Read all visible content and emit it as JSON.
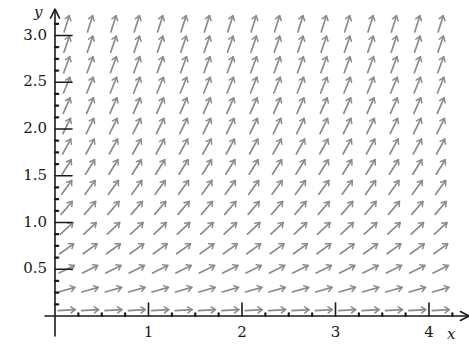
{
  "figure": {
    "kind": "slope-field",
    "title": "",
    "background_color": "#ffffff",
    "axis_color": "#1a1a1a",
    "field_color": "#8a8a92",
    "width": 469,
    "height": 345
  },
  "axes": {
    "x_axis": {
      "label": "x",
      "min": 0,
      "max": 4.4,
      "origin_px": 55,
      "unit_px": 93.5,
      "baseline_px": 316,
      "arrow": true,
      "major_ticks": [
        1,
        2,
        3,
        4
      ],
      "major_tick_labels": [
        "1",
        "2",
        "3",
        "4"
      ],
      "minor_tick_step": 0.25
    },
    "y_axis": {
      "label": "y",
      "min": 0,
      "max": 3.25,
      "origin_px": 316,
      "unit_px": 93.5,
      "baseline_px": 55,
      "arrow": true,
      "major_ticks": [
        0.5,
        1.0,
        1.5,
        2.0,
        2.5,
        3.0
      ],
      "major_tick_labels": [
        "0.5",
        "1.0",
        "1.5",
        "2.0",
        "2.5",
        "3.0"
      ],
      "minor_tick_step": 0.125
    }
  },
  "chart_data": {
    "type": "scatter",
    "title": "",
    "xlabel": "x",
    "ylabel": "y",
    "xlim": [
      0,
      4.4
    ],
    "ylim": [
      0,
      3.25
    ],
    "grid": false,
    "legend": "none",
    "arrow_grid": {
      "x_start": 0.125,
      "x_step": 0.25,
      "x_count": 17,
      "y_start": 0.0625,
      "y_step": 0.21875,
      "y_count": 15,
      "arrow_length_px": 17,
      "arrowhead": "open-up-right"
    },
    "slope_rule": "dy/dx = y",
    "sample_slopes": [
      {
        "y": 0.06,
        "angle_deg": 26
      },
      {
        "y": 0.28,
        "angle_deg": 30
      },
      {
        "y": 0.5,
        "angle_deg": 34
      },
      {
        "y": 0.72,
        "angle_deg": 38
      },
      {
        "y": 0.94,
        "angle_deg": 43
      },
      {
        "y": 1.16,
        "angle_deg": 47
      },
      {
        "y": 1.38,
        "angle_deg": 51
      },
      {
        "y": 1.59,
        "angle_deg": 55
      },
      {
        "y": 1.81,
        "angle_deg": 58
      },
      {
        "y": 2.03,
        "angle_deg": 61
      },
      {
        "y": 2.25,
        "angle_deg": 64
      },
      {
        "y": 2.47,
        "angle_deg": 66
      },
      {
        "y": 2.69,
        "angle_deg": 68
      },
      {
        "y": 2.91,
        "angle_deg": 70
      },
      {
        "y": 3.13,
        "angle_deg": 72
      }
    ]
  }
}
